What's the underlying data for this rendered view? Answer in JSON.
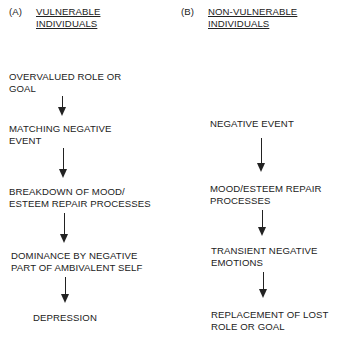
{
  "panel_a": {
    "label": "(A)",
    "title_line1": "VULNERABLE",
    "title_line2": "INDIVIDUALS",
    "steps": [
      {
        "line1": "OVERVALUED ROLE OR",
        "line2": "GOAL"
      },
      {
        "line1": "MATCHING NEGATIVE",
        "line2": "EVENT"
      },
      {
        "line1": "BREAKDOWN OF MOOD/",
        "line2": "ESTEEM REPAIR PROCESSES"
      },
      {
        "line1": "DOMINANCE BY NEGATIVE",
        "line2": "PART OF AMBIVALENT SELF"
      },
      {
        "line1": "DEPRESSION",
        "line2": ""
      }
    ]
  },
  "panel_b": {
    "label": "(B)",
    "title_line1": "NON-VULNERABLE",
    "title_line2": "INDIVIDUALS",
    "steps": [
      {
        "line1": "NEGATIVE EVENT",
        "line2": ""
      },
      {
        "line1": "MOOD/ESTEEM REPAIR",
        "line2": "PROCESSES"
      },
      {
        "line1": "TRANSIENT NEGATIVE",
        "line2": "EMOTIONS"
      },
      {
        "line1": "REPLACEMENT OF LOST",
        "line2": "ROLE OR GOAL"
      }
    ]
  },
  "colors": {
    "ink": "#222222",
    "background": "#ffffff"
  }
}
